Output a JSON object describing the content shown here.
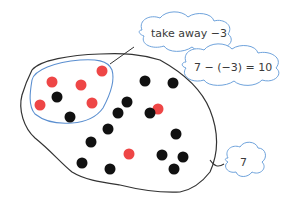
{
  "colors": {
    "red_counter": "#ee4646",
    "black_counter": "#111111",
    "outline": "#333333",
    "loop": "#5b8fd0",
    "cloud_stroke": "#6fa3dc"
  },
  "labels": {
    "take_away": "take away −3",
    "equation": "7 − (−3) = 10",
    "total": "7"
  },
  "counters": {
    "red": [
      [
        52,
        82
      ],
      [
        81,
        85
      ],
      [
        102,
        71
      ],
      [
        40,
        105
      ],
      [
        92,
        103
      ],
      [
        158,
        109
      ],
      [
        129,
        154
      ]
    ],
    "black": [
      [
        57,
        97
      ],
      [
        70,
        117
      ],
      [
        145,
        81
      ],
      [
        127,
        102
      ],
      [
        118,
        113
      ],
      [
        108,
        129
      ],
      [
        91,
        142
      ],
      [
        150,
        113
      ],
      [
        173,
        83
      ],
      [
        82,
        163
      ],
      [
        162,
        155
      ],
      [
        110,
        169
      ],
      [
        176,
        134
      ],
      [
        183,
        157
      ],
      [
        174,
        169
      ]
    ]
  }
}
